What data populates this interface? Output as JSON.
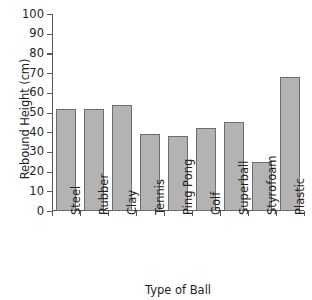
{
  "chart_data": {
    "type": "bar",
    "title": "",
    "xlabel": "Type of Ball",
    "ylabel": "Rebound Height (cm)",
    "categories": [
      "Steel",
      "Rubber",
      "Clay",
      "Tennis",
      "Ping Pong",
      "Golf",
      "Superball",
      "Styrofoam",
      "Plastic"
    ],
    "values": [
      52,
      52,
      54,
      39,
      38,
      42,
      45,
      25,
      68
    ],
    "ylim": [
      0,
      100
    ],
    "ytick_labels": [
      "100",
      "90",
      "80",
      "70",
      "60",
      "50",
      "40",
      "30",
      "20",
      "10",
      "0"
    ],
    "ytick_values": [
      100,
      90,
      80,
      70,
      60,
      50,
      40,
      30,
      20,
      10,
      0
    ],
    "grid": false,
    "legend": false,
    "bar_fill_color": "#b3b3b3",
    "bar_border_color": "#6d6e71",
    "axis_color": "#58595b",
    "text_color": "#231f20"
  }
}
